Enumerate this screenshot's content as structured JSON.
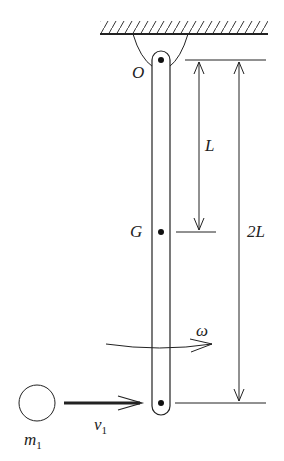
{
  "diagram": {
    "type": "physics-pendulum-rod-collision",
    "labels": {
      "pivot": "O",
      "center_of_mass": "G",
      "half_length": "L",
      "full_length": "2L",
      "angular_velocity": "ω",
      "velocity": "v",
      "velocity_sub": "1",
      "mass": "m",
      "mass_sub": "1"
    },
    "colors": {
      "line": "#222222",
      "background": "#ffffff"
    }
  }
}
